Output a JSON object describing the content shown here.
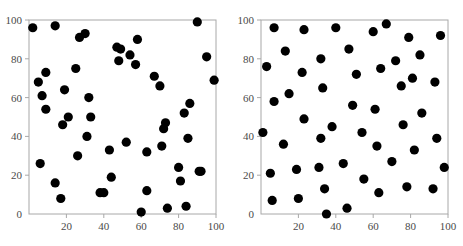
{
  "figure": {
    "panels": [
      "left-panel",
      "right-panel"
    ],
    "background_color": "#ffffff",
    "point_color": "#000000",
    "axis_color": "#a8a8a8",
    "tick_label_color": "#4a4a4a"
  },
  "chart_data": [
    {
      "type": "scatter",
      "title": "",
      "xlabel": "",
      "ylabel": "",
      "xlim": [
        0,
        100
      ],
      "ylim": [
        0,
        100
      ],
      "xticks": [
        20,
        40,
        60,
        80,
        100
      ],
      "yticks": [
        0,
        20,
        40,
        60,
        80,
        100
      ],
      "xtick_labels": [
        "20",
        "40",
        "60",
        "80",
        "100"
      ],
      "ytick_labels": [
        "0",
        "20",
        "40",
        "60",
        "80",
        "100"
      ],
      "grid": false,
      "legend": false,
      "marker": "circle",
      "marker_color": "#000000",
      "marker_size": 5,
      "n_points": 60,
      "points": [
        [
          2,
          96
        ],
        [
          5,
          68
        ],
        [
          7,
          61
        ],
        [
          9,
          73
        ],
        [
          9,
          54
        ],
        [
          6,
          26
        ],
        [
          14,
          97
        ],
        [
          14,
          16
        ],
        [
          17,
          8
        ],
        [
          19,
          64
        ],
        [
          18,
          46
        ],
        [
          21,
          50
        ],
        [
          25,
          75
        ],
        [
          27,
          91
        ],
        [
          26,
          30
        ],
        [
          30,
          93
        ],
        [
          32,
          60
        ],
        [
          31,
          40
        ],
        [
          33,
          50
        ],
        [
          38,
          11
        ],
        [
          40,
          11
        ],
        [
          43,
          33
        ],
        [
          44,
          19
        ],
        [
          47,
          86
        ],
        [
          49,
          85
        ],
        [
          48,
          79
        ],
        [
          52,
          37
        ],
        [
          54,
          82
        ],
        [
          57,
          77
        ],
        [
          58,
          90
        ],
        [
          60,
          1
        ],
        [
          63,
          32
        ],
        [
          63,
          12
        ],
        [
          67,
          71
        ],
        [
          70,
          66
        ],
        [
          71,
          35
        ],
        [
          72,
          44
        ],
        [
          73,
          47
        ],
        [
          74,
          3
        ],
        [
          80,
          24
        ],
        [
          81,
          17
        ],
        [
          84,
          4
        ],
        [
          83,
          52
        ],
        [
          85,
          39
        ],
        [
          86,
          57
        ],
        [
          90,
          99
        ],
        [
          91,
          22
        ],
        [
          92,
          22
        ],
        [
          95,
          81
        ],
        [
          99,
          69
        ]
      ]
    },
    {
      "type": "scatter",
      "title": "",
      "xlabel": "",
      "ylabel": "",
      "xlim": [
        0,
        100
      ],
      "ylim": [
        0,
        100
      ],
      "xticks": [
        20,
        40,
        60,
        80,
        100
      ],
      "yticks": [
        0,
        20,
        40,
        60,
        80,
        100
      ],
      "xtick_labels": [
        "20",
        "40",
        "60",
        "80",
        "100"
      ],
      "ytick_labels": [
        "0",
        "20",
        "40",
        "60",
        "80",
        "100"
      ],
      "grid": false,
      "legend": false,
      "marker": "circle",
      "marker_color": "#000000",
      "marker_size": 5,
      "n_points": 50,
      "points": [
        [
          1,
          42
        ],
        [
          3,
          76
        ],
        [
          5,
          21
        ],
        [
          6,
          7
        ],
        [
          7,
          96
        ],
        [
          7,
          58
        ],
        [
          12,
          36
        ],
        [
          13,
          84
        ],
        [
          15,
          62
        ],
        [
          19,
          23
        ],
        [
          20,
          8
        ],
        [
          22,
          73
        ],
        [
          23,
          95
        ],
        [
          23,
          49
        ],
        [
          31,
          24
        ],
        [
          32,
          39
        ],
        [
          32,
          80
        ],
        [
          33,
          65
        ],
        [
          34,
          13
        ],
        [
          35,
          0
        ],
        [
          38,
          45
        ],
        [
          40,
          96
        ],
        [
          44,
          26
        ],
        [
          46,
          3
        ],
        [
          47,
          85
        ],
        [
          49,
          56
        ],
        [
          51,
          72
        ],
        [
          54,
          42
        ],
        [
          55,
          18
        ],
        [
          60,
          94
        ],
        [
          61,
          54
        ],
        [
          62,
          35
        ],
        [
          63,
          11
        ],
        [
          64,
          75
        ],
        [
          67,
          98
        ],
        [
          70,
          27
        ],
        [
          72,
          79
        ],
        [
          75,
          66
        ],
        [
          76,
          46
        ],
        [
          78,
          14
        ],
        [
          79,
          91
        ],
        [
          81,
          70
        ],
        [
          82,
          33
        ],
        [
          85,
          82
        ],
        [
          86,
          52
        ],
        [
          92,
          13
        ],
        [
          93,
          68
        ],
        [
          94,
          39
        ],
        [
          96,
          92
        ],
        [
          98,
          24
        ]
      ]
    }
  ]
}
